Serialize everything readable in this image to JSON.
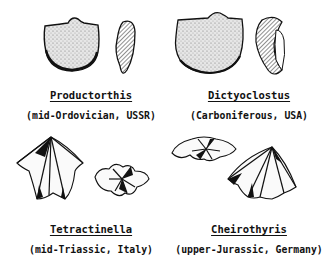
{
  "figures": [
    {
      "genus": "Productorthis",
      "origin": "(mid-Ordovician, USSR)",
      "views": [
        "dorsal-view",
        "lateral-section-view"
      ]
    },
    {
      "genus": "Dictyoclostus",
      "origin": "(Carboniferous, USA)",
      "views": [
        "dorsal-view",
        "lateral-section-view"
      ]
    },
    {
      "genus": "Tetractinella",
      "origin": "(mid-Triassic, Italy)",
      "views": [
        "dorsal-view",
        "anterior-view"
      ]
    },
    {
      "genus": "Cheirothyris",
      "origin": "(upper-Jurassic, Germany)",
      "views": [
        "anterior-view",
        "dorsal-view"
      ]
    }
  ],
  "colors": {
    "ink": "#111111",
    "paper": "#ffffff",
    "stipple": "#c8c8c8"
  }
}
